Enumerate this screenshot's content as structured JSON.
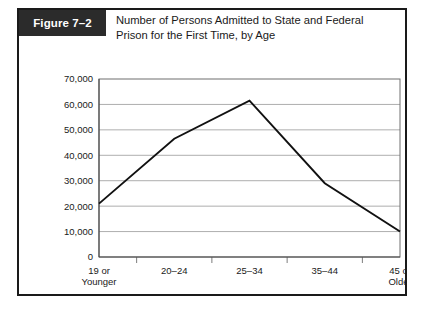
{
  "figure": {
    "label": "Figure 7–2",
    "title_line_1": "Number of Persons Admitted to State and Federal",
    "title_line_2": "Prison for the First Time, by Age",
    "label_box_color": "#2b2b2b",
    "label_text_color": "#ffffff",
    "border_color": "#1a1a1a",
    "background_color": "#ffffff"
  },
  "chart_data": {
    "type": "line",
    "title": "Number of Persons Admitted to State and Federal Prison for the First Time, by Age",
    "xlabel": "",
    "ylabel": "",
    "categories": [
      "19 or Younger",
      "20–24",
      "25–34",
      "35–44",
      "45 or Older"
    ],
    "category_lines": [
      [
        "19 or",
        "Younger"
      ],
      [
        "20–24",
        ""
      ],
      [
        "25–34",
        ""
      ],
      [
        "35–44",
        ""
      ],
      [
        "45 or",
        "Older"
      ]
    ],
    "values": [
      21000,
      46500,
      61500,
      29000,
      10000
    ],
    "ylim": [
      0,
      70000
    ],
    "ytick_values": [
      0,
      10000,
      20000,
      30000,
      40000,
      50000,
      60000,
      70000
    ],
    "ytick_labels": [
      "0",
      "10,000",
      "20,000",
      "30,000",
      "40,000",
      "50,000",
      "60,000",
      "70,000"
    ],
    "grid": true,
    "grid_axis": "y",
    "legend": false,
    "legend_position": "none",
    "line_color": "#111111",
    "grid_color": "#8a8a8a",
    "axis_color": "#4a4a4a",
    "markers": false
  }
}
